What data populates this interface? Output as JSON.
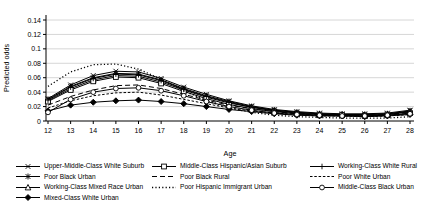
{
  "figure": {
    "background": "#ffffff",
    "line_color": "#000000",
    "gridline_color": "#c8c8c8"
  },
  "chart_data": {
    "type": "line",
    "title": "",
    "xlabel": "Age",
    "ylabel": "Predicted odds",
    "x": [
      12,
      13,
      14,
      15,
      16,
      17,
      18,
      19,
      20,
      21,
      22,
      23,
      24,
      25,
      26,
      27,
      28
    ],
    "y_tick_labels": [
      "0",
      "0.02",
      "0.04",
      "0.06",
      "0.08",
      "0.1",
      "0.12",
      "0.14"
    ],
    "y_tick_values": [
      0,
      0.02,
      0.04,
      0.06,
      0.08,
      0.1,
      0.12,
      0.14
    ],
    "ylim": [
      0,
      0.14
    ],
    "grid": true,
    "legend_position": "bottom",
    "series": [
      {
        "name": "Upper-Middle-Class White Suburb",
        "line": "solid",
        "marker": "x",
        "values": [
          0.031,
          0.05,
          0.063,
          0.069,
          0.068,
          0.059,
          0.047,
          0.037,
          0.028,
          0.021,
          0.016,
          0.013,
          0.011,
          0.01,
          0.01,
          0.011,
          0.015
        ]
      },
      {
        "name": "Poor Black Urban",
        "line": "solid",
        "marker": "asterisk",
        "values": [
          0.03,
          0.048,
          0.06,
          0.066,
          0.065,
          0.057,
          0.045,
          0.035,
          0.027,
          0.02,
          0.015,
          0.012,
          0.01,
          0.009,
          0.009,
          0.01,
          0.014
        ]
      },
      {
        "name": "Working-Class Mixed Race Urban",
        "line": "solid",
        "marker": "triangle-open",
        "values": [
          0.028,
          0.045,
          0.057,
          0.063,
          0.062,
          0.054,
          0.043,
          0.033,
          0.025,
          0.019,
          0.014,
          0.011,
          0.009,
          0.009,
          0.008,
          0.009,
          0.013
        ]
      },
      {
        "name": "Mixed-Class White Urban",
        "line": "solid",
        "marker": "diamond-filled",
        "values": [
          0.014,
          0.022,
          0.026,
          0.028,
          0.029,
          0.027,
          0.024,
          0.02,
          0.016,
          0.013,
          0.01,
          0.008,
          0.007,
          0.007,
          0.006,
          0.007,
          0.009
        ]
      },
      {
        "name": "Middle-Class Hispanic/Asian Suburb",
        "line": "solid",
        "marker": "square-open",
        "values": [
          0.027,
          0.043,
          0.055,
          0.061,
          0.06,
          0.052,
          0.041,
          0.031,
          0.023,
          0.017,
          0.013,
          0.01,
          0.008,
          0.008,
          0.007,
          0.008,
          0.011
        ]
      },
      {
        "name": "Poor Black Rural",
        "line": "long-dash",
        "marker": "none",
        "values": [
          0.022,
          0.034,
          0.043,
          0.049,
          0.05,
          0.045,
          0.037,
          0.029,
          0.022,
          0.017,
          0.013,
          0.01,
          0.009,
          0.008,
          0.008,
          0.009,
          0.012
        ]
      },
      {
        "name": "Poor Hispanic Immigrant Urban",
        "line": "dotted",
        "marker": "none",
        "values": [
          0.048,
          0.068,
          0.078,
          0.079,
          0.072,
          0.058,
          0.042,
          0.028,
          0.018,
          0.012,
          0.008,
          0.006,
          0.005,
          0.004,
          0.004,
          0.004,
          0.006
        ]
      },
      {
        "name": "Working-Class White Rural",
        "line": "solid",
        "marker": "plus",
        "values": [
          0.029,
          0.047,
          0.059,
          0.065,
          0.064,
          0.056,
          0.044,
          0.034,
          0.026,
          0.019,
          0.015,
          0.012,
          0.01,
          0.009,
          0.009,
          0.01,
          0.013
        ]
      },
      {
        "name": "Poor White Urban",
        "line": "short-dash",
        "marker": "none",
        "values": [
          0.018,
          0.028,
          0.035,
          0.039,
          0.04,
          0.036,
          0.03,
          0.024,
          0.018,
          0.014,
          0.011,
          0.009,
          0.007,
          0.007,
          0.006,
          0.007,
          0.009
        ]
      },
      {
        "name": "Middle-Class Black Urban",
        "line": "solid",
        "marker": "circle-open",
        "values": [
          0.012,
          0.03,
          0.04,
          0.045,
          0.046,
          0.042,
          0.035,
          0.027,
          0.02,
          0.015,
          0.011,
          0.009,
          0.008,
          0.007,
          0.007,
          0.008,
          0.01
        ]
      }
    ],
    "legend_columns": [
      [
        0,
        1,
        2,
        3
      ],
      [
        4,
        5,
        6
      ],
      [
        7,
        8,
        9
      ]
    ]
  }
}
